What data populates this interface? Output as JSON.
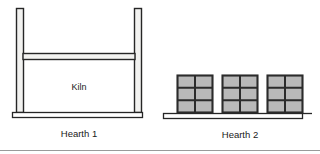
{
  "figure": {
    "background_color": "#ffffff",
    "line_color": "#262626",
    "fill_light": "#f2f2f0",
    "brick_fill": "#b9b9b9",
    "brick_line": "#2b2b2b",
    "bottom_rule_color": "#9a9a9a"
  },
  "hearth1": {
    "label": "Hearth 1",
    "kiln_label": "Kiln",
    "left_post": {
      "name": "left-post"
    },
    "right_post": {
      "name": "right-post"
    },
    "beam": {
      "name": "cross-beam"
    },
    "baseline": {
      "name": "hearth-1-baseline"
    }
  },
  "hearth2": {
    "label": "Hearth 2",
    "baseline": {
      "name": "hearth-2-baseline"
    },
    "stacks": [
      {
        "name": "brick-stack-1",
        "columns": 2,
        "rows": 3
      },
      {
        "name": "brick-stack-2",
        "columns": 2,
        "rows": 3
      },
      {
        "name": "brick-stack-3",
        "columns": 2,
        "rows": 3
      }
    ]
  }
}
